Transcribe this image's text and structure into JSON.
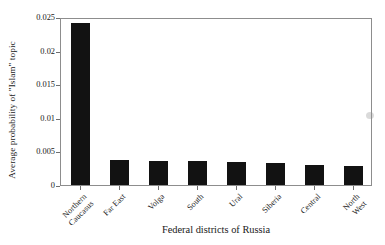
{
  "chart_data": {
    "type": "bar",
    "title": "",
    "xlabel": "Federal districts of Russia",
    "ylabel": "Average probability of \"Islam\" topic",
    "categories": [
      "Northern Caucasus",
      "Far East",
      "Volga",
      "South",
      "Ural",
      "Siberia",
      "Central",
      "North West"
    ],
    "category_lines": [
      [
        "Northern",
        "Caucasus"
      ],
      [
        "Far East"
      ],
      [
        "Volga"
      ],
      [
        "South"
      ],
      [
        "Ural"
      ],
      [
        "Siberia"
      ],
      [
        "Central"
      ],
      [
        "North",
        "West"
      ]
    ],
    "values": [
      0.0241,
      0.0037,
      0.0035,
      0.0035,
      0.0034,
      0.0033,
      0.003,
      0.0029
    ],
    "ylim": [
      0,
      0.025
    ],
    "yticks": [
      0,
      0.005,
      0.01,
      0.015,
      0.02,
      0.025
    ],
    "ytick_labels": [
      "0",
      "0.005",
      "0.01",
      "0.015",
      "0.02",
      "0.025"
    ],
    "grid": false,
    "legend": null,
    "bar_color": "#121212",
    "axis_color": "#8d8d8d"
  }
}
